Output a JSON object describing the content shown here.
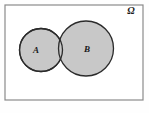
{
  "figure": {
    "kind": "venn-diagram",
    "caption": "",
    "width": 149,
    "height": 113
  },
  "colors": {
    "page_background": "#fefefe",
    "universe_fill": "#ffffff",
    "universe_border": "#8a8a8a",
    "circle_fill": "#c8c8c8",
    "circle_stroke": "#2b2b2b",
    "label_color": "#1a1a1a"
  },
  "universe": {
    "label": "Ω",
    "label_name": "omega",
    "x": 5,
    "y": 5,
    "width": 138,
    "height": 95,
    "border_width": 1.2,
    "label_x": 131,
    "label_y": 14,
    "label_font_size": 10
  },
  "sets": [
    {
      "id": "A",
      "label": "A",
      "cx": 41,
      "cy": 50,
      "r": 21.5,
      "stroke_width": 1.3,
      "label_x": 36,
      "label_y": 53,
      "label_font_size": 9
    },
    {
      "id": "B",
      "label": "B",
      "cx": 86,
      "cy": 48.5,
      "r": 27.5,
      "stroke_width": 1.3,
      "label_x": 87,
      "label_y": 52,
      "label_font_size": 9
    }
  ],
  "relations": {
    "overlap": "A and B intersect in a small lens-shaped region",
    "intersection_nonempty": true
  }
}
